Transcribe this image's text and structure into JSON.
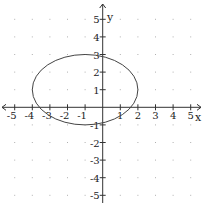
{
  "chart_data": {
    "type": "line",
    "title": "",
    "xlabel": "x",
    "ylabel": "y",
    "xlim": [
      -5,
      5
    ],
    "ylim": [
      -5,
      5
    ],
    "grid": "dots",
    "x_ticks": [
      -5,
      -4,
      -3,
      -2,
      -1,
      1,
      2,
      3,
      4,
      5
    ],
    "y_ticks": [
      5,
      4,
      3,
      2,
      1,
      -1,
      -2,
      -3,
      -4,
      -5
    ],
    "series": [
      {
        "name": "ellipse",
        "shape": "ellipse",
        "center": [
          -1,
          1
        ],
        "semi_axis_x": 3,
        "semi_axis_y": 2,
        "equation": "(x+1)^2/9 + (y-1)^2/4 = 1",
        "color": "#444444"
      }
    ]
  },
  "axes": {
    "x_label": "x",
    "y_label": "y",
    "x_tick_labels": [
      "-5",
      "-4",
      "-3",
      "-2",
      "-1",
      "1",
      "2",
      "3",
      "4",
      "5"
    ],
    "y_tick_labels": [
      "5",
      "4",
      "3",
      "2",
      "1",
      "-1",
      "-2",
      "-3",
      "-4",
      "-5"
    ]
  }
}
